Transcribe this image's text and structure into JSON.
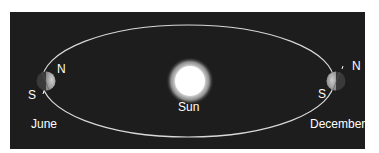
{
  "diagram": {
    "sun": {
      "label": "Sun"
    },
    "positions": [
      {
        "month": "June",
        "north_label": "N",
        "south_label": "S"
      },
      {
        "month": "December",
        "north_label": "N",
        "south_label": "S"
      }
    ],
    "colors": {
      "background": "#1d1d1d",
      "orbit": "#d9d9d9",
      "sun": "#ffffff",
      "text": "#ffffff"
    }
  }
}
